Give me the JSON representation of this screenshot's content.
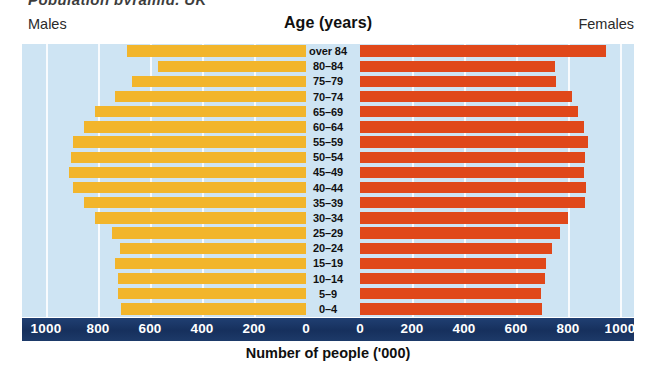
{
  "figure": {
    "top_partial_text": "Population pyramid, UK",
    "axis_title": "Number of people  ('000)",
    "header": {
      "left_label": "Males",
      "center_label": "Age (years)",
      "right_label": "Females"
    },
    "colors": {
      "male_bar": "#f2b52b",
      "female_bar": "#e0481a",
      "plot_background": "#cee4f3",
      "axis_band": "#1b3a6b",
      "gridline": "#ffffff",
      "text": "#111111"
    }
  },
  "chart_data": {
    "type": "bar",
    "subtype": "population-pyramid",
    "title": "Age (years)",
    "xlabel": "Number of people  ('000)",
    "ylabel": "Age (years)",
    "orientation": "horizontal",
    "categories": [
      "over 84",
      "80–84",
      "75–79",
      "70–74",
      "65–69",
      "60–64",
      "55–59",
      "50–54",
      "45–49",
      "40–44",
      "35–39",
      "30–34",
      "25–29",
      "20–24",
      "15–19",
      "10–14",
      "5–9",
      "0–4"
    ],
    "series": [
      {
        "name": "Males",
        "side": "left",
        "color": "#f2b52b",
        "values": [
          690,
          570,
          670,
          735,
          810,
          855,
          895,
          905,
          910,
          895,
          855,
          810,
          745,
          715,
          735,
          725,
          725,
          710
        ]
      },
      {
        "name": "Females",
        "side": "right",
        "color": "#e0481a",
        "values": [
          945,
          750,
          755,
          815,
          840,
          860,
          875,
          865,
          860,
          870,
          865,
          800,
          770,
          740,
          715,
          710,
          695,
          700
        ]
      }
    ],
    "left_axis": {
      "ticks": [
        1000,
        800,
        600,
        400,
        200,
        0
      ],
      "range": [
        1000,
        0
      ],
      "units": "thousands"
    },
    "right_axis": {
      "ticks": [
        0,
        200,
        400,
        600,
        800,
        1000
      ],
      "range": [
        0,
        1000
      ],
      "units": "thousands"
    },
    "tick_labels_left": [
      "1000",
      "800",
      "600",
      "400",
      "200",
      "0"
    ],
    "tick_labels_right": [
      "0",
      "200",
      "400",
      "600",
      "800",
      "1000"
    ],
    "legend": [
      "Males",
      "Females"
    ],
    "legend_position": "top-left-and-top-right",
    "grid": true
  }
}
